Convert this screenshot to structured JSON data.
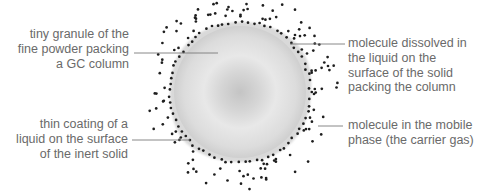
{
  "diagram": {
    "colors": {
      "label_text": "#6a6a6a",
      "leader_line": "#7a7a7a",
      "molecule_dot": "#1e1e1e",
      "granule_center": "#c4c4c4",
      "granule_mid": "#e6e6e6",
      "granule_edge": "#d4d4d4"
    },
    "granule": {
      "cx": 240,
      "cy": 92,
      "r": 68
    },
    "labels": {
      "granule": {
        "lines": [
          "tiny granule of the",
          "fine powder packing",
          "a GC column"
        ]
      },
      "coating": {
        "lines": [
          "thin coating of a",
          "liquid on the surface",
          "of the inert solid"
        ]
      },
      "dissolved": {
        "lines": [
          "molecule dissolved in",
          "the liquid on the",
          "surface of the solid",
          "packing the column"
        ]
      },
      "mobile": {
        "lines": [
          "molecule in the mobile",
          "phase (the carrier gas)"
        ]
      }
    },
    "leaders": [
      {
        "name": "granule",
        "x1": 134,
        "y1": 53,
        "x2": 218,
        "y2": 53
      },
      {
        "name": "coating",
        "x1": 132,
        "y1": 140,
        "x2": 190,
        "y2": 140
      },
      {
        "name": "dissolved",
        "x1": 290,
        "y1": 44,
        "x2": 345,
        "y2": 44
      },
      {
        "name": "mobile",
        "x1": 318,
        "y1": 126,
        "x2": 343,
        "y2": 126
      }
    ]
  }
}
